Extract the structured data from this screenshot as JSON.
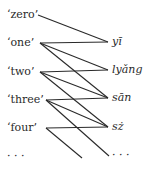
{
  "diagram": {
    "left_items": [
      {
        "label": "‘zero’",
        "y": 15
      },
      {
        "label": "‘one’",
        "y": 43
      },
      {
        "label": "‘two’",
        "y": 72
      },
      {
        "label": "‘three’",
        "y": 100
      },
      {
        "label": "‘four’",
        "y": 128
      },
      {
        "label": "· · ·",
        "y": 157
      }
    ],
    "right_items": [
      {
        "label": "yī",
        "y": 42
      },
      {
        "label": "lyǎng",
        "y": 70
      },
      {
        "label": "sān",
        "y": 98
      },
      {
        "label": "sż",
        "y": 127
      },
      {
        "label": "· · ·",
        "y": 156
      }
    ],
    "edges": [
      [
        "‘zero’",
        "yī"
      ],
      [
        "‘one’",
        "yī"
      ],
      [
        "‘one’",
        "lyǎng"
      ],
      [
        "‘one’",
        "sān"
      ],
      [
        "‘two’",
        "lyǎng"
      ],
      [
        "‘two’",
        "sān"
      ],
      [
        "‘two’",
        "sż"
      ],
      [
        "‘three’",
        "sān"
      ],
      [
        "‘three’",
        "sż"
      ],
      [
        "‘three’",
        "· · ·"
      ],
      [
        "‘four’",
        "sż"
      ],
      [
        "‘four’",
        "· · ·"
      ]
    ],
    "line_color": "#2a2a2a"
  }
}
